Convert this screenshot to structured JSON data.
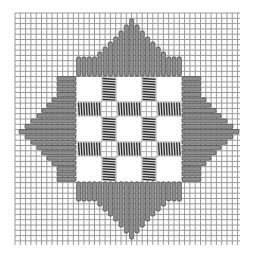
{
  "diagram": {
    "colors": {
      "background": "#ffffff",
      "grid": "#9a9a9a",
      "stitch_fill": "#8c8c8c",
      "stitch_edge": "#3a3a3a",
      "coil_dark": "#2a2a2a",
      "window": "#ffffff"
    },
    "grid": {
      "x0": 15,
      "y0": 13,
      "x1": 240,
      "y1": 245,
      "spacing": 5.3
    },
    "center_square": {
      "x": 76,
      "y": 76,
      "size": 106
    },
    "windows": {
      "positions": [
        77,
        117,
        157
      ],
      "size": 24
    },
    "bars": {
      "positions": [
        101,
        141
      ],
      "thickness": 16
    },
    "triangles": {
      "cell": 5.3,
      "profile": [
        19,
        19,
        19,
        19,
        24,
        29,
        34,
        39,
        45,
        51,
        57,
        51,
        45,
        39,
        34,
        29,
        24,
        19,
        19,
        19
      ],
      "top": {
        "orientation": "vertical-stitches"
      },
      "bottom": {
        "orientation": "vertical-stitches"
      },
      "left": {
        "orientation": "horizontal-stitches"
      },
      "right": {
        "orientation": "horizontal-stitches"
      }
    }
  }
}
